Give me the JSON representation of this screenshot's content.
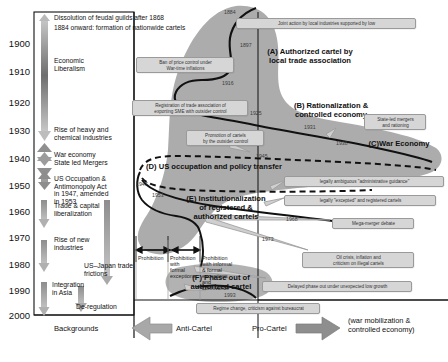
{
  "figure": {
    "timeline_years": [
      "1900",
      "1910",
      "1920",
      "1930",
      "1940",
      "1950",
      "1960",
      "1970",
      "1980",
      "1990",
      "2000"
    ],
    "top_notes": [
      "Dissolution of feudal guilds after 1868",
      "1884 onward:  formation of nationwide cartels"
    ],
    "backgrounds": [
      {
        "label": "Economic\nLiberalism"
      },
      {
        "label": "Rise of heavy and\nchemical industries"
      },
      {
        "label": "War economy\nState led Mergers"
      },
      {
        "label": "US Occupation &\nAntimonopoly Act\nin 1947, amended\nin 1953"
      },
      {
        "label": "Trade & capital\nliberalization"
      },
      {
        "label": "Rise of new\nindustries"
      },
      {
        "label": "US–Japan trade\nfrictions"
      },
      {
        "label": "Integration\nin Asia"
      },
      {
        "label": "De-regulation"
      }
    ],
    "phases": [
      {
        "id": "A",
        "label": "(A) Authorized cartel by\nlocal trade association"
      },
      {
        "id": "B",
        "label": "(B) Rationalization &\ncontrolled economy"
      },
      {
        "id": "C",
        "label": "(C)War Economy"
      },
      {
        "id": "D",
        "label": "(D) US occupation and policy transfer"
      },
      {
        "id": "E",
        "label": "(E) Institutionalization\nof  registered  &\nauthorized cartels"
      },
      {
        "id": "F",
        "label": "(F) Phase out of\nauthorized cartel"
      }
    ],
    "callouts": [
      {
        "text": "Joint action by local industries supported by low"
      },
      {
        "text": "Ban of price control under\nWar-time inflations"
      },
      {
        "text": "Registration of trade association of\nexporting SME with outsider control"
      },
      {
        "text": "Promotion of cartels\nby the outsider control"
      },
      {
        "text": "State-led mergers\nand rationing"
      },
      {
        "text": "legally ambiguous \"administrative guidance\""
      },
      {
        "text": "legally \"excepted\" and registered cartels"
      },
      {
        "text": "Mega-merger debate"
      },
      {
        "text": "Oil crisis, inflation and\ncriticism on illegal cartels"
      },
      {
        "text": "Delayed phase out under unexpected low growth"
      },
      {
        "text": "Regime change, criticism against bureaucrat"
      }
    ],
    "year_marks": [
      "1884",
      "1897",
      "1916",
      "1925",
      "1931",
      "1938",
      "1945",
      "1947",
      "1953",
      "1968",
      "1973",
      "1993"
    ],
    "prohibition_bands": [
      {
        "label": "Prohibition"
      },
      {
        "label": "Prohibition with\nformal  exceptions"
      },
      {
        "label": "Prohibition\nwith informal\n& formal\nexceptions and\nconnivance"
      }
    ],
    "axis": {
      "backgrounds_label": "Backgrounds",
      "anti_cartel_label": "Anti-Cartel",
      "pro_cartel_label": "Pro-Cartel",
      "corner_note": "(war mobilization &\ncontrolled economy)"
    },
    "colors": {
      "blob": "#9a9a9a",
      "callout_fill": "#d6d6d6",
      "callout_border": "#9a9a9a",
      "arrow_gray": "#a8a8a8",
      "curve": "#111111"
    }
  }
}
